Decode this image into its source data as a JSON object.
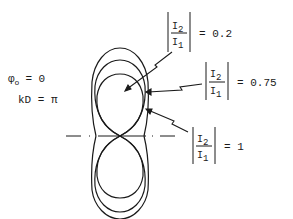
{
  "diagram": {
    "type": "radiation-pattern",
    "parameters": {
      "phi_symbol": "φ",
      "phi_subscript": "o",
      "phi_eq": "= 0",
      "kd_label": "kD = π"
    },
    "curves": [
      {
        "label_num": "I",
        "num_sub": "2",
        "label_den": "I",
        "den_sub": "1",
        "value": "= 0.2"
      },
      {
        "label_num": "I",
        "num_sub": "2",
        "label_den": "I",
        "den_sub": "1",
        "value": "= 0.75"
      },
      {
        "label_num": "I",
        "num_sub": "2",
        "label_den": "I",
        "den_sub": "1",
        "value": "= 1"
      }
    ],
    "colors": {
      "ink": "#1a1a1a",
      "background": "#ffffff"
    }
  }
}
